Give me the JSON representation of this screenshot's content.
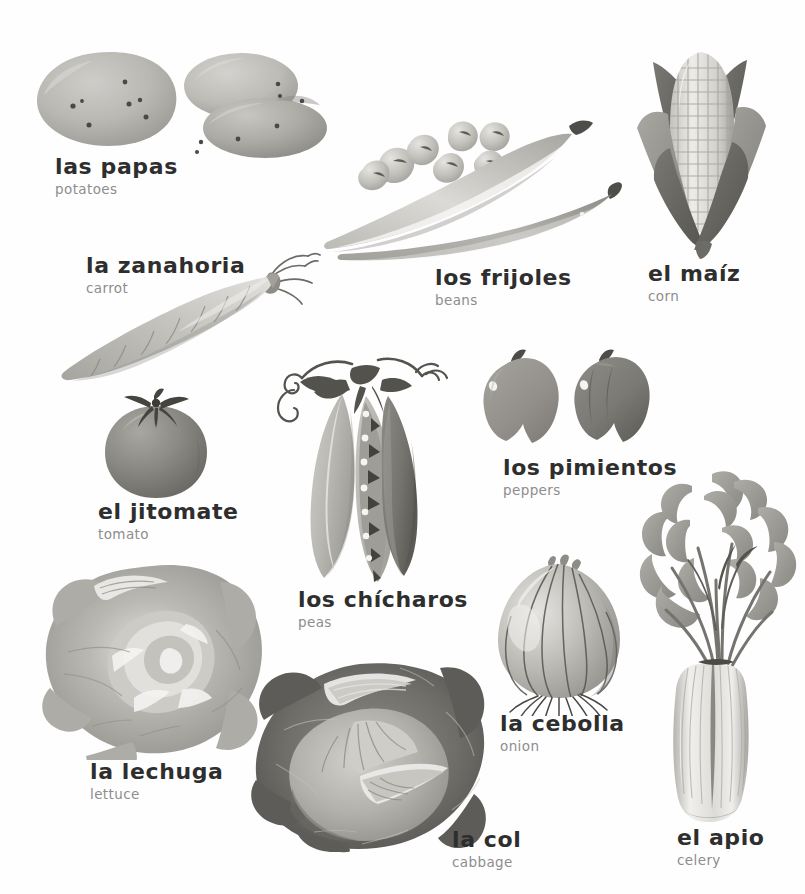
{
  "page": {
    "language_pair": "Spanish - English",
    "background_color": "#fefefe",
    "term_color": "#2e2e2e",
    "gloss_color": "#8d8d8d",
    "render_style": "grayscale watercolor illustration",
    "width": 805,
    "height": 894
  },
  "entries": [
    {
      "id": "papas",
      "term": "las papas",
      "gloss": "potatoes",
      "icon": "potatoes-illustration",
      "label_x": 55,
      "label_y": 155,
      "art_x": 28,
      "art_y": 45,
      "art_w": 300,
      "art_h": 110
    },
    {
      "id": "zanahoria",
      "term": "la zanahoria",
      "gloss": "carrot",
      "icon": "carrot-illustration",
      "label_x": 86,
      "label_y": 254,
      "art_x": 60,
      "art_y": 246,
      "art_w": 260,
      "art_h": 135
    },
    {
      "id": "frijoles",
      "term": "los frijoles",
      "gloss": "beans",
      "icon": "beans-illustration",
      "label_x": 435,
      "label_y": 266,
      "art_x": 322,
      "art_y": 112,
      "art_w": 300,
      "art_h": 150
    },
    {
      "id": "maiz",
      "term": "el maíz",
      "gloss": "corn",
      "icon": "corn-illustration",
      "label_x": 648,
      "label_y": 262,
      "art_x": 626,
      "art_y": 42,
      "art_w": 150,
      "art_h": 215
    },
    {
      "id": "jitomate",
      "term": "el jitomate",
      "gloss": "tomato",
      "icon": "tomato-illustration",
      "label_x": 98,
      "label_y": 500,
      "art_x": 96,
      "art_y": 388,
      "art_w": 118,
      "art_h": 110
    },
    {
      "id": "pimientos",
      "term": "los pimientos",
      "gloss": "peppers",
      "icon": "peppers-illustration",
      "label_x": 503,
      "label_y": 456,
      "art_x": 478,
      "art_y": 345,
      "art_w": 200,
      "art_h": 110
    },
    {
      "id": "chicharos",
      "term": "los chícharos",
      "gloss": "peas",
      "icon": "peapods-illustration",
      "label_x": 298,
      "label_y": 588,
      "art_x": 256,
      "art_y": 352,
      "art_w": 210,
      "art_h": 230
    },
    {
      "id": "cebolla",
      "term": "la cebolla",
      "gloss": "onion",
      "icon": "onion-illustration",
      "label_x": 500,
      "label_y": 712,
      "art_x": 482,
      "art_y": 548,
      "art_w": 155,
      "art_h": 165
    },
    {
      "id": "lechuga",
      "term": "la lechuga",
      "gloss": "lettuce",
      "icon": "lettuce-illustration",
      "label_x": 90,
      "label_y": 760,
      "art_x": 36,
      "art_y": 562,
      "art_w": 232,
      "art_h": 196
    },
    {
      "id": "col",
      "term": "la col",
      "gloss": "cabbage",
      "icon": "cabbage-illustration",
      "label_x": 452,
      "label_y": 828,
      "art_x": 252,
      "art_y": 662,
      "art_w": 235,
      "art_h": 190
    },
    {
      "id": "apio",
      "term": "el apio",
      "gloss": "celery",
      "icon": "celery-illustration",
      "label_x": 677,
      "label_y": 826,
      "art_x": 640,
      "art_y": 470,
      "art_w": 160,
      "art_h": 352
    }
  ],
  "palette": {
    "ink_dark": "#3c3c3c",
    "gray_deep": "#5f5f5f",
    "gray_mid": "#8a8a8a",
    "gray_light": "#b4b4b4",
    "gray_pale": "#d6d6d6",
    "gray_faint": "#eceaea",
    "highlight": "#f7f7f5"
  }
}
